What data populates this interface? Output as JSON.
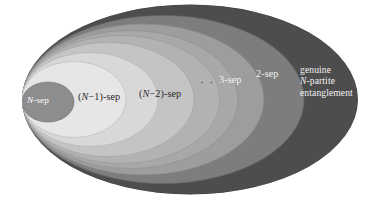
{
  "figure": {
    "kind": "nested-ellipses-venn",
    "background": "#ffffff",
    "width": 380,
    "height": 199
  },
  "colors": {
    "outer_shell": "#4d4d4d",
    "band_2sep": "#7d7d7d",
    "band_3sep": "#9d9d9d",
    "band_dots": "#adadad",
    "band_n2sep": "#c0c0c0",
    "band_n1sep": "#d4d4d4",
    "band_inner_light": "#e3e3e3",
    "core_nsep": "#8d8d8d",
    "stroke": "#6a6a6a",
    "label_dark": "#2b2b2b",
    "label_light": "#f2f2f2",
    "label_white": "#ffffff"
  },
  "ellipses": [
    {
      "name": "outer-all-states",
      "cx": 190,
      "cy": 99.5,
      "rx": 168,
      "ry": 95,
      "fill": "#4d4d4d"
    },
    {
      "name": "shell-2sep",
      "cx": 163,
      "cy": 99.5,
      "rx": 141,
      "ry": 84,
      "fill": "#7d7d7d"
    },
    {
      "name": "shell-3sep",
      "cx": 143,
      "cy": 99.5,
      "rx": 121,
      "ry": 75.5,
      "fill": "#9d9d9d"
    },
    {
      "name": "shell-dots-a",
      "cx": 130,
      "cy": 99.5,
      "rx": 108,
      "ry": 69,
      "fill": "#a8a8a8"
    },
    {
      "name": "shell-dots-b",
      "cx": 121,
      "cy": 99.5,
      "rx": 99,
      "ry": 64,
      "fill": "#b2b2b2"
    },
    {
      "name": "shell-n2sep",
      "cx": 108,
      "cy": 99.5,
      "rx": 86,
      "ry": 57,
      "fill": "#c4c4c4"
    },
    {
      "name": "shell-n1sep",
      "cx": 90,
      "cy": 99.5,
      "rx": 68,
      "ry": 47,
      "fill": "#d8d8d8"
    },
    {
      "name": "shell-inner-light",
      "cx": 74,
      "cy": 99.5,
      "rx": 52,
      "ry": 38,
      "fill": "#e6e6e6"
    },
    {
      "name": "core-nsep",
      "cx": 48,
      "cy": 102,
      "rx": 26,
      "ry": 20,
      "fill": "#8d8d8d"
    }
  ],
  "labels": {
    "n_sep": "N-sep",
    "n_sep_italic": "N",
    "n_minus_1_sep_pre": "(",
    "n_minus_1_sep_var": "N",
    "n_minus_1_sep_post": "−1)-sep",
    "n_minus_2_sep_post": "−2)-sep",
    "ellipsis": "· · ·",
    "three_sep": "3-sep",
    "two_sep": "2-sep",
    "genuine_line1": "genuine",
    "genuine_line2_var": "N",
    "genuine_line2_rest": "-partite",
    "genuine_line3": "entanglement"
  }
}
